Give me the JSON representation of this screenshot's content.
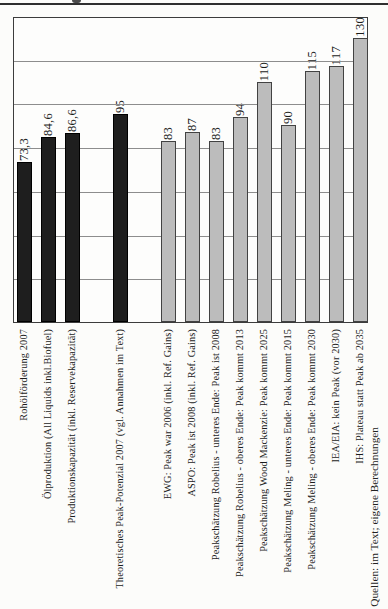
{
  "source_note": "Quellen: im Text; eigene Berechnungen",
  "colors": {
    "black_bar": "#1e1e1e",
    "gray_bar": "#bcbcbc",
    "gridline": "#8d8d8d",
    "plot_border": "#3c3c3c"
  },
  "chart_data": {
    "type": "bar",
    "title": "",
    "xlabel": "",
    "ylabel": "",
    "ylim": [
      0,
      140
    ],
    "gridline_step": 20,
    "grid": true,
    "axis_tick_labels_visible": false,
    "orientation_note": "all labels rotated 90deg, reading bottom-to-top",
    "categories": [
      "Rohölförderung 2007",
      "Ölproduktion (All Liquids inkl.Biofuel)",
      "Produktionskapazität (inkl. Reservekapazität)",
      "Theoretisches Peak-Potenzial 2007 (vgl. Annahmen im Text)",
      "EWG: Peak war 2006 (inkl. Ref. Gains)",
      "ASPO: Peak ist 2008 (inkl. Ref. Gains)",
      "Peakschätzung Robelius - unteres Ende: Peak ist 2008",
      "Peakschätzung Robelius - oberes Ende: Peak kommt 2013",
      "Peakschätzung Wood Mackenzie: Peak kommt 2025",
      "Peakschätzung Meling - unteres Ende: Peak kommt 2015",
      "Peakschätzung Meling - oberes Ende: Peak kommt 2030",
      "IEA/EIA: kein Peak (vor 2030)",
      "IHS: Plateau statt Peak ab 2035"
    ],
    "values": [
      73.3,
      84.6,
      86.6,
      95,
      83,
      87,
      83,
      94,
      110,
      90,
      115,
      117,
      130
    ],
    "value_labels": [
      "73,3",
      "84,6",
      "86,6",
      "95",
      "83",
      "87",
      "83",
      "94",
      "110",
      "90",
      "115",
      "117",
      "130"
    ],
    "bar_colors": [
      "black",
      "black",
      "black",
      "black",
      "gray",
      "gray",
      "gray",
      "gray",
      "gray",
      "gray",
      "gray",
      "gray",
      "gray"
    ],
    "slots": [
      0,
      1,
      2,
      4,
      6,
      7,
      8,
      9,
      10,
      11,
      12,
      13,
      14
    ]
  }
}
